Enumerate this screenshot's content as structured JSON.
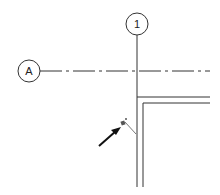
{
  "diagram": {
    "grid_bubbles": [
      {
        "id": "col-1",
        "label": "1",
        "cx": 137,
        "cy": 24,
        "r": 11
      },
      {
        "id": "row-A",
        "label": "A",
        "cx": 29,
        "cy": 71,
        "r": 11
      }
    ],
    "colors": {
      "line": "#333333",
      "background": "#ffffff",
      "marker": "#555555"
    }
  }
}
